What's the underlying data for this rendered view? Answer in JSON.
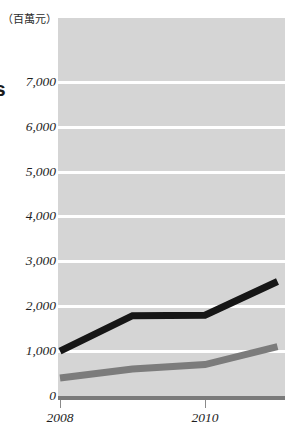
{
  "unit_label": "（百萬元）",
  "title_fragment": "s",
  "colors": {
    "plot_background": "#d5d5d5",
    "gridline": "#ffffff",
    "axis": "#7a7a7a",
    "series_black": "#161616",
    "series_gray": "#7c7c7c",
    "text": "#1e1e1e"
  },
  "chart_data": {
    "type": "line",
    "title": "",
    "subtitle": "",
    "xlabel": "",
    "ylabel": "（百萬元）",
    "grid": true,
    "legend_position": "none",
    "x": [
      2008,
      2009,
      2010,
      2011
    ],
    "xtick_labels": [
      "2008",
      "2010"
    ],
    "xtick_values": [
      2008,
      2010
    ],
    "xlim": [
      2008,
      2011.1
    ],
    "ylim": [
      0,
      7600
    ],
    "ytick_labels": [
      "0",
      "1,000",
      "2,000",
      "3,000",
      "4,000",
      "5,000",
      "6,000",
      "7,000"
    ],
    "ytick_values": [
      0,
      1000,
      2000,
      3000,
      4000,
      5000,
      6000,
      7000
    ],
    "series": [
      {
        "name": "series-black",
        "color": "#161616",
        "width": 7,
        "values": [
          1000,
          1790,
          1800,
          2550
        ]
      },
      {
        "name": "series-gray",
        "color": "#7c7c7c",
        "width": 7,
        "values": [
          400,
          600,
          700,
          1100
        ]
      }
    ]
  }
}
